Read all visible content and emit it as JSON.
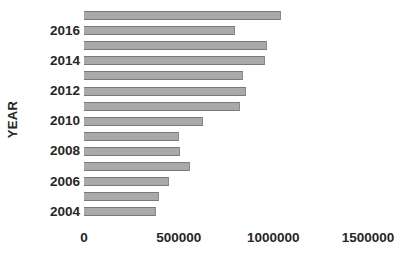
{
  "chart_data": {
    "type": "bar",
    "orientation": "horizontal",
    "title": "",
    "xlabel": "",
    "ylabel": "YEAR",
    "xlim": [
      0,
      1500000
    ],
    "ylim": null,
    "grid": false,
    "legend": null,
    "x_ticks": [
      {
        "value": 0,
        "label": "0"
      },
      {
        "value": 500000,
        "label": "500000"
      },
      {
        "value": 1000000,
        "label": "1000000"
      },
      {
        "value": 1500000,
        "label": "1500000"
      }
    ],
    "y_tick_labels": [
      "2016",
      "2014",
      "2012",
      "2010",
      "2008",
      "2006",
      "2004"
    ],
    "categories": [
      "2017",
      "2016",
      "2015",
      "2014",
      "2013",
      "2012",
      "2011",
      "2010",
      "2009",
      "2008",
      "2007",
      "2006",
      "2005",
      "2004"
    ],
    "values": [
      1042000,
      798000,
      968000,
      957000,
      840000,
      856000,
      825000,
      628000,
      500000,
      505000,
      560000,
      447000,
      394000,
      378000
    ],
    "bar_color": "#a9a9a9",
    "bar_edge_color": "#7a7a7a"
  }
}
